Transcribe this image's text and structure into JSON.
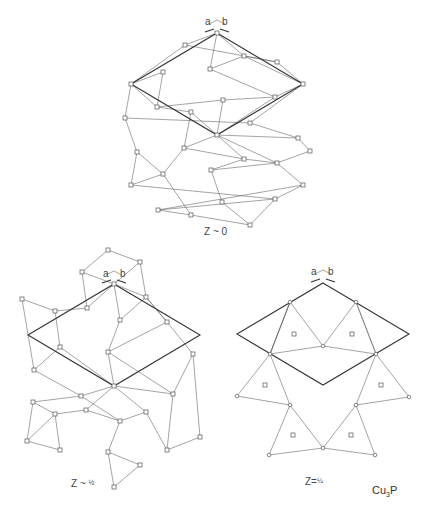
{
  "figure": {
    "compound": "Cu",
    "compound_sub": "3",
    "compound_tail": "P",
    "colors": {
      "line": "#666666",
      "cell": "#333333",
      "background": "#ffffff"
    }
  },
  "panels": [
    {
      "id": "top",
      "label": "Z ~ 0",
      "axis_a": "a",
      "axis_b": "b",
      "cell": [
        [
          217,
          33
        ],
        [
          303,
          84
        ],
        [
          217,
          135
        ],
        [
          131,
          84
        ]
      ],
      "nodes": [
        [
          217,
          33
        ],
        [
          185,
          45
        ],
        [
          244,
          56
        ],
        [
          210,
          69
        ],
        [
          277,
          62
        ],
        [
          163,
          72
        ],
        [
          131,
          84
        ],
        [
          303,
          84
        ],
        [
          275,
          97
        ],
        [
          223,
          100
        ],
        [
          157,
          107
        ],
        [
          191,
          112
        ],
        [
          125,
          118
        ],
        [
          250,
          123
        ],
        [
          217,
          135
        ],
        [
          298,
          138
        ],
        [
          184,
          148
        ],
        [
          310,
          151
        ],
        [
          137,
          152
        ],
        [
          244,
          159
        ],
        [
          277,
          163
        ],
        [
          163,
          174
        ],
        [
          211,
          170
        ],
        [
          131,
          185
        ],
        [
          303,
          185
        ],
        [
          222,
          202
        ],
        [
          275,
          199
        ],
        [
          158,
          210
        ],
        [
          191,
          215
        ],
        [
          250,
          225
        ]
      ],
      "edges": [
        [
          0,
          1
        ],
        [
          0,
          3
        ],
        [
          0,
          2
        ],
        [
          1,
          6
        ],
        [
          1,
          4
        ],
        [
          2,
          4
        ],
        [
          3,
          2
        ],
        [
          3,
          8
        ],
        [
          2,
          7
        ],
        [
          4,
          7
        ],
        [
          5,
          6
        ],
        [
          5,
          10
        ],
        [
          6,
          10
        ],
        [
          6,
          12
        ],
        [
          7,
          8
        ],
        [
          7,
          13
        ],
        [
          8,
          14
        ],
        [
          9,
          10
        ],
        [
          9,
          8
        ],
        [
          9,
          14
        ],
        [
          10,
          11
        ],
        [
          11,
          14
        ],
        [
          11,
          16
        ],
        [
          12,
          13
        ],
        [
          12,
          18
        ],
        [
          13,
          15
        ],
        [
          14,
          15
        ],
        [
          14,
          16
        ],
        [
          14,
          19
        ],
        [
          14,
          20
        ],
        [
          15,
          17
        ],
        [
          16,
          19
        ],
        [
          16,
          21
        ],
        [
          18,
          21
        ],
        [
          18,
          23
        ],
        [
          19,
          20
        ],
        [
          19,
          22
        ],
        [
          20,
          17
        ],
        [
          20,
          24
        ],
        [
          21,
          23
        ],
        [
          21,
          28
        ],
        [
          22,
          25
        ],
        [
          22,
          20
        ],
        [
          23,
          26
        ],
        [
          24,
          27
        ],
        [
          24,
          26
        ],
        [
          25,
          29
        ],
        [
          26,
          29
        ],
        [
          26,
          27
        ],
        [
          27,
          28
        ],
        [
          28,
          29
        ]
      ]
    },
    {
      "id": "bottom-left",
      "label": "Z ~ ",
      "label_frac": "½",
      "axis_a": "a",
      "axis_b": "b",
      "cell": [
        [
          114,
          284
        ],
        [
          200,
          335
        ],
        [
          114,
          386
        ],
        [
          28,
          335
        ]
      ],
      "nodes": [
        [
          108,
          250
        ],
        [
          140,
          262
        ],
        [
          82,
          272
        ],
        [
          114,
          284
        ],
        [
          146,
          297
        ],
        [
          87,
          308
        ],
        [
          22,
          299
        ],
        [
          55,
          311
        ],
        [
          120,
          320
        ],
        [
          167,
          322
        ],
        [
          60,
          347
        ],
        [
          34,
          370
        ],
        [
          108,
          352
        ],
        [
          193,
          354
        ],
        [
          114,
          386
        ],
        [
          81,
          396
        ],
        [
          173,
          394
        ],
        [
          146,
          412
        ],
        [
          86,
          410
        ],
        [
          120,
          421
        ],
        [
          33,
          402
        ],
        [
          55,
          414
        ],
        [
          27,
          441
        ],
        [
          60,
          450
        ],
        [
          167,
          450
        ],
        [
          200,
          437
        ],
        [
          108,
          452
        ],
        [
          140,
          465
        ],
        [
          114,
          487
        ]
      ],
      "edges": [
        [
          0,
          1
        ],
        [
          0,
          2
        ],
        [
          1,
          3
        ],
        [
          1,
          4
        ],
        [
          2,
          3
        ],
        [
          2,
          5
        ],
        [
          3,
          4
        ],
        [
          3,
          5
        ],
        [
          3,
          8
        ],
        [
          4,
          9
        ],
        [
          4,
          8
        ],
        [
          5,
          7
        ],
        [
          6,
          7
        ],
        [
          6,
          11
        ],
        [
          7,
          10
        ],
        [
          8,
          12
        ],
        [
          9,
          13
        ],
        [
          9,
          12
        ],
        [
          10,
          11
        ],
        [
          10,
          14
        ],
        [
          11,
          15
        ],
        [
          12,
          14
        ],
        [
          12,
          16
        ],
        [
          13,
          16
        ],
        [
          13,
          25
        ],
        [
          14,
          15
        ],
        [
          14,
          16
        ],
        [
          14,
          17
        ],
        [
          14,
          18
        ],
        [
          15,
          20
        ],
        [
          15,
          19
        ],
        [
          16,
          24
        ],
        [
          17,
          19
        ],
        [
          17,
          24
        ],
        [
          18,
          19
        ],
        [
          18,
          21
        ],
        [
          19,
          26
        ],
        [
          20,
          21
        ],
        [
          20,
          22
        ],
        [
          21,
          22
        ],
        [
          21,
          23
        ],
        [
          22,
          23
        ],
        [
          24,
          25
        ],
        [
          26,
          27
        ],
        [
          26,
          28
        ],
        [
          27,
          28
        ],
        [
          9,
          4
        ]
      ]
    },
    {
      "id": "bottom-right",
      "label": "Z=",
      "label_frac": "¼",
      "axis_a": "a",
      "axis_b": "b",
      "cell": [
        [
          323,
          283
        ],
        [
          409,
          334
        ],
        [
          323,
          385
        ],
        [
          237,
          334
        ]
      ],
      "nodes": [
        [
          290,
          302
        ],
        [
          356,
          302
        ],
        [
          323,
          346
        ],
        [
          270,
          354
        ],
        [
          376,
          354
        ],
        [
          237,
          396
        ],
        [
          409,
          397
        ],
        [
          290,
          405
        ],
        [
          356,
          405
        ],
        [
          269,
          455
        ],
        [
          323,
          448
        ],
        [
          375,
          455
        ]
      ],
      "open_nodes": [
        [
          294,
          334
        ],
        [
          352,
          334
        ],
        [
          265,
          385
        ],
        [
          381,
          385
        ],
        [
          293,
          435
        ],
        [
          351,
          435
        ]
      ],
      "edges": [
        [
          0,
          3
        ],
        [
          0,
          2
        ],
        [
          1,
          2
        ],
        [
          1,
          4
        ],
        [
          0,
          3
        ],
        [
          1,
          4
        ],
        [
          3,
          2
        ],
        [
          2,
          4
        ],
        [
          3,
          5
        ],
        [
          3,
          7
        ],
        [
          5,
          7
        ],
        [
          4,
          6
        ],
        [
          4,
          8
        ],
        [
          6,
          8
        ],
        [
          7,
          9
        ],
        [
          7,
          10
        ],
        [
          9,
          10
        ],
        [
          8,
          10
        ],
        [
          8,
          11
        ],
        [
          10,
          11
        ],
        [
          0,
          270
        ],
        [
          3,
          0
        ]
      ]
    }
  ]
}
